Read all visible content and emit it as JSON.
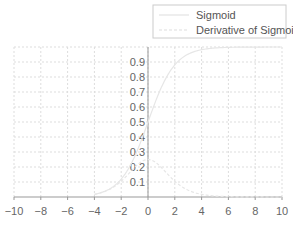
{
  "chart_data": {
    "type": "line",
    "title": "",
    "xlabel": "",
    "ylabel": "",
    "xlim": [
      -10,
      10
    ],
    "ylim": [
      0,
      1
    ],
    "grid": true,
    "legend_position": "top-right",
    "x_ticks": [
      "−10",
      "−8",
      "−6",
      "−4",
      "−2",
      "0",
      "2",
      "4",
      "6",
      "8",
      "10"
    ],
    "y_ticks": [
      "0.1",
      "0.2",
      "0.3",
      "0.4",
      "0.5",
      "0.6",
      "0.7",
      "0.8",
      "0.9"
    ],
    "x": [
      -4,
      -3,
      -2,
      -1,
      0,
      1,
      2,
      3,
      4,
      5,
      6,
      7,
      8,
      9,
      10
    ],
    "series": [
      {
        "name": "Sigmoid",
        "style": "solid",
        "color": "#e6e6e6",
        "values": [
          0.018,
          0.047,
          0.119,
          0.269,
          0.5,
          0.731,
          0.881,
          0.953,
          0.982,
          0.993,
          0.998,
          0.999,
          1.0,
          1.0,
          1.0
        ]
      },
      {
        "name": "Derivative of Sigmoid",
        "style": "dashed",
        "color": "#e6e6e6",
        "values": [
          0.018,
          0.045,
          0.105,
          0.197,
          0.25,
          0.197,
          0.105,
          0.045,
          0.018,
          0.007,
          0.002,
          0.001,
          0.0,
          0.0,
          0.0
        ]
      }
    ]
  },
  "legend": {
    "items": [
      {
        "label": "Sigmoid",
        "style": "solid"
      },
      {
        "label": "Derivative of Sigmoid",
        "style": "dashed"
      }
    ]
  },
  "colors": {
    "grid": "#dddddd",
    "axis": "#999999",
    "curve": "#e6e6e6",
    "tick_text": "#666666"
  }
}
